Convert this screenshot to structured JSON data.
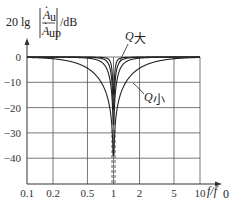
{
  "chart_data": {
    "type": "line",
    "title": "",
    "ylabel": "20 lg |Ȧu / Ȧup| /dB",
    "ylabel_parts": {
      "prefix": "20 lg",
      "num": "A",
      "num_sub": "u",
      "den": "A",
      "den_sub": "up",
      "unit": "/dB"
    },
    "xlabel": "f/f0",
    "xlabel_parts": {
      "f": "f",
      "slash": "/",
      "f0": "f",
      "f0_sub": "0"
    },
    "xscale": "log",
    "x_ticks": [
      "0.1",
      "0.2",
      "0.5",
      "1",
      "2",
      "5",
      "10"
    ],
    "x_tick_values": [
      0.1,
      0.2,
      0.5,
      1,
      2,
      5,
      10
    ],
    "y_ticks": [
      "0",
      "-10",
      "-20",
      "-30",
      "-40"
    ],
    "y_tick_values": [
      0,
      -10,
      -20,
      -30,
      -40
    ],
    "ylim": [
      -50,
      0
    ],
    "xlim": [
      0.1,
      10
    ],
    "grid": true,
    "series": [
      {
        "name": "Q大",
        "Q": 8,
        "description": "narrow notch, high Q"
      },
      {
        "name": "Q mid-1",
        "Q": 4
      },
      {
        "name": "Q mid-2",
        "Q": 2
      },
      {
        "name": "Q小",
        "Q": 0.5,
        "description": "wide notch, low Q"
      }
    ],
    "annotations": [
      {
        "text": "Q大",
        "base": "Q",
        "sub": "大",
        "points_to": "narrowest curve"
      },
      {
        "text": "Q小",
        "base": "Q",
        "sub": "小",
        "points_to": "widest curve"
      }
    ]
  },
  "labels": {
    "q_big": "Q",
    "q_big_sub": "大",
    "q_small": "Q",
    "q_small_sub": "小"
  }
}
